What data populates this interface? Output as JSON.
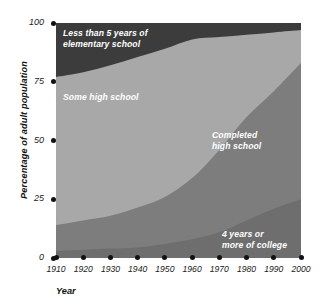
{
  "chart_data": {
    "type": "area",
    "title": "",
    "xlabel": "Year",
    "ylabel": "Percentage of adult population",
    "x": [
      1910,
      1920,
      1930,
      1940,
      1950,
      1960,
      1970,
      1980,
      1990,
      2000
    ],
    "xtick_labels": [
      "1910",
      "1920",
      "1930",
      "1940",
      "1950",
      "1960",
      "1970",
      "1980",
      "1990",
      "2000"
    ],
    "ytick_labels": [
      "0",
      "25",
      "50",
      "75",
      "100"
    ],
    "yticks": [
      0,
      25,
      50,
      75,
      100
    ],
    "xlim": [
      1910,
      2000
    ],
    "ylim": [
      0,
      100
    ],
    "grid": false,
    "legend": "in-plot area labels",
    "stacked": true,
    "stack_order": "bottom-to-top",
    "series": [
      {
        "name": "4 years or more of college",
        "color": "#6e6e6e",
        "values": [
          3,
          3.5,
          4,
          4.5,
          6,
          8,
          11,
          16,
          21,
          25
        ]
      },
      {
        "name": "Completed high school",
        "color": "#7d7d7d",
        "values": [
          11,
          12.5,
          14,
          17,
          20,
          26,
          35,
          44,
          50,
          58
        ]
      },
      {
        "name": "Some high school",
        "color": "#a8a8a8",
        "values": [
          63,
          63,
          64,
          64,
          63,
          59,
          48,
          35,
          25,
          14
        ]
      },
      {
        "name": "Less than 5 years of elementary school",
        "color": "#3c3c3c",
        "values": [
          23,
          21,
          18,
          14.5,
          11,
          7,
          6,
          5,
          4,
          3
        ]
      }
    ],
    "cumulative_upper_bounds": {
      "college": [
        3,
        3.5,
        4,
        4.5,
        6,
        8,
        11,
        16,
        21,
        25
      ],
      "completed_high_school": [
        14,
        16,
        18,
        21.5,
        26,
        34,
        46,
        60,
        71,
        83
      ],
      "some_high_school": [
        77,
        79,
        82,
        85.5,
        89,
        93,
        94,
        95,
        96,
        97
      ],
      "less_than_5_years": [
        100,
        100,
        100,
        100,
        100,
        100,
        100,
        100,
        100,
        100
      ]
    },
    "annotations": [
      {
        "text": "Less than 5 years of\nelementary school",
        "series": "Less than 5 years of elementary school"
      },
      {
        "text": "Some high school",
        "series": "Some high school"
      },
      {
        "text": "Completed\nhigh school",
        "series": "Completed high school"
      },
      {
        "text": "4 years or\nmore of college",
        "series": "4 years or more of college"
      }
    ]
  },
  "axes": {
    "y_title": "Percentage of adult population",
    "x_title": "Year",
    "y_ticks": [
      {
        "label": "100",
        "value": 100
      },
      {
        "label": "75",
        "value": 75
      },
      {
        "label": "50",
        "value": 50
      },
      {
        "label": "25",
        "value": 25
      },
      {
        "label": "0",
        "value": 0
      }
    ],
    "x_ticks": [
      {
        "label": "1910",
        "value": 1910
      },
      {
        "label": "1920",
        "value": 1920
      },
      {
        "label": "1930",
        "value": 1930
      },
      {
        "label": "1940",
        "value": 1940
      },
      {
        "label": "1950",
        "value": 1950
      },
      {
        "label": "1960",
        "value": 1960
      },
      {
        "label": "1970",
        "value": 1970
      },
      {
        "label": "1980",
        "value": 1980
      },
      {
        "label": "1990",
        "value": 1990
      },
      {
        "label": "2000",
        "value": 2000
      }
    ]
  },
  "labels": {
    "elementary": "Less than 5 years of\nelementary school",
    "some_high_school": "Some high school",
    "completed_high_school": "Completed\nhigh school",
    "college": "4 years or\nmore of college"
  },
  "colors": {
    "less_than_5_years": "#3c3c3c",
    "some_high_school": "#a8a8a8",
    "completed_high_school": "#7d7d7d",
    "college": "#6e6e6e",
    "axis": "#111111",
    "background": "#ffffff",
    "label_text": "#ffffff"
  }
}
